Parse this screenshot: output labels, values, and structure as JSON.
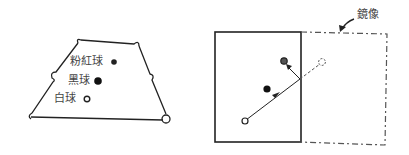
{
  "left_diagram": {
    "title": "pool table with balls",
    "labels": {
      "pink_ball": "粉紅球",
      "black_ball": "黑球",
      "white_ball": "白球"
    }
  },
  "right_diagram": {
    "title": "mirror image shot",
    "labels": {
      "mirror": "鏡像"
    }
  },
  "colors": {
    "line": "#222222",
    "text": "#444444",
    "dashed": "#555555"
  }
}
